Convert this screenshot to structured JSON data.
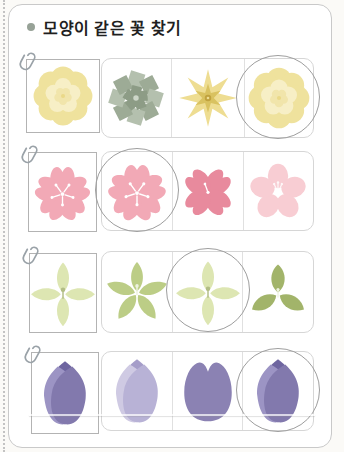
{
  "title": {
    "text": "모양이 같은 꽃 찾기"
  },
  "answer_marker": "circle",
  "worksheet": {
    "rows": [
      {
        "id": "yellow-flower-row",
        "reference_flower": "layered-round-yellow-flower",
        "candidates": [
          "square-petal-pinwheel-flower",
          "pointed-star-yellow-flower",
          "layered-round-yellow-flower"
        ],
        "answer_index": 2
      },
      {
        "id": "cherry-blossom-row",
        "reference_flower": "five-petal-pink-cherry-blossom",
        "candidates": [
          "five-petal-pink-cherry-blossom",
          "four-petal-notched-pink-flower",
          "five-round-petal-pink-flower"
        ],
        "answer_index": 0
      },
      {
        "id": "green-flower-row",
        "reference_flower": "four-petal-green-cross-flower",
        "candidates": [
          "five-petal-green-star-flower",
          "four-petal-green-cross-flower",
          "three-petal-green-flower"
        ],
        "answer_index": 1
      },
      {
        "id": "tulip-row",
        "reference_flower": "pointed-purple-tulip",
        "candidates": [
          "pointed-lavender-tulip",
          "round-lobed-purple-tulip",
          "pointed-purple-tulip"
        ],
        "answer_index": 2
      }
    ]
  },
  "colors": {
    "page_border": "#c9c9c9",
    "refbox_border": "#b3b3b3",
    "strip_border": "#d6d6d6",
    "divider": "#e0e0e0",
    "circle": "#9e9e9e",
    "title_text": "#1f1f1f",
    "bullet": "#97a297",
    "clip": "#9aa2a8",
    "yellow_outer": "#efe29d",
    "yellow_mid": "#f7efc6",
    "yellow_inner": "#f1e5ab",
    "yellow_dot": "#ead988",
    "pinwheel_a": "#b4c0ae",
    "pinwheel_b": "#9dab96",
    "pinwheel_center": "#8d9c86",
    "pinwheel_dot": "#cdd6c8",
    "star_outer": "#eedd92",
    "star_inner": "#d9c260",
    "star_center": "#c0a23e",
    "blossom_pink": "#f2a9b6",
    "blossom_dark": "#e88a9d",
    "blossom_light": "#f8cdd3",
    "stamen": "#ffffff",
    "green_pale": "#dde6b2",
    "green_detail": "#b2bd85",
    "green_mid": "#bccd86",
    "green_dark": "#a2b46a",
    "green_light_mark": "#eef2e0",
    "tulip_mid": "#6e65a0",
    "tulip_left": "#9c94c4",
    "tulip_right": "#8279ad",
    "lav_mid": "#a59dc9",
    "lav_left": "#cfcae3",
    "lav_right": "#b8b2d6",
    "tulip_round": "#8b82b3"
  }
}
